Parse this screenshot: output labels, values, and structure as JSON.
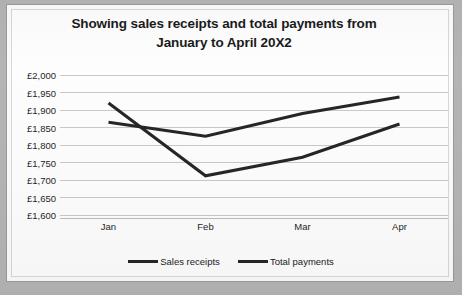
{
  "chart_data": {
    "type": "line",
    "title": "Showing sales receipts and total payments from January to April 20X2",
    "title_line1": "Showing sales receipts and total payments from",
    "title_line2": "January to April 20X2",
    "xlabel": "",
    "ylabel": "",
    "categories": [
      "Jan",
      "Feb",
      "Mar",
      "Apr"
    ],
    "ylim": [
      1600,
      2000
    ],
    "ytick_step": 50,
    "ytick_labels": [
      "£2,000",
      "£1,950",
      "£1,900",
      "£1,850",
      "£1,800",
      "£1,750",
      "£1,700",
      "£1,650",
      "£1,600"
    ],
    "ytick_values": [
      2000,
      1950,
      1900,
      1850,
      1800,
      1750,
      1700,
      1650,
      1600
    ],
    "grid": true,
    "legend_position": "bottom",
    "currency_symbol": "£",
    "series": [
      {
        "name": "Sales receipts",
        "color": "#262626",
        "values": [
          1920,
          1712,
          1765,
          1860
        ]
      },
      {
        "name": "Total payments",
        "color": "#262626",
        "values": [
          1865,
          1825,
          1890,
          1937
        ]
      }
    ]
  },
  "colors": {
    "line": "#262626",
    "gridline": "#c9c9c9",
    "axis": "#bdbdbd",
    "frame": "#9a9a9a",
    "plot_background": "#fdfdfd",
    "page_background": "#b4b4b4",
    "text": "#1b1b1b"
  }
}
